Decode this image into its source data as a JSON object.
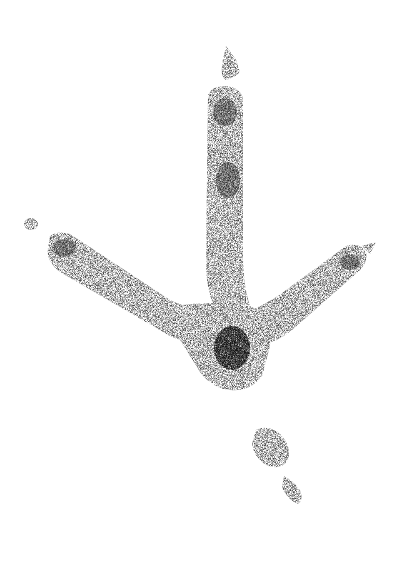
{
  "illustration": {
    "subject": "bird-track",
    "style": "stipple",
    "ink_color": "#2a2a2a",
    "background": "#ffffff",
    "parts": [
      {
        "name": "middle-toe",
        "direction": "up"
      },
      {
        "name": "left-toe",
        "direction": "upper-left"
      },
      {
        "name": "right-toe",
        "direction": "upper-right"
      },
      {
        "name": "heel-pad",
        "position": "center"
      },
      {
        "name": "hind-toe",
        "direction": "down-right"
      }
    ]
  }
}
